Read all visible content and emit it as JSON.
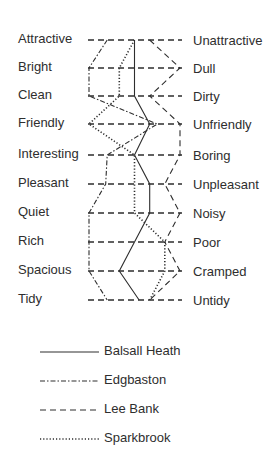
{
  "chart_data": {
    "type": "line",
    "title": "",
    "orientation": "semantic-differential profile (vertical scales)",
    "scale": {
      "min": 1,
      "max": 7,
      "x_left_px": 89,
      "x_right_px": 180
    },
    "left_labels": [
      "Attractive",
      "Bright",
      "Clean",
      "Friendly",
      "Interesting",
      "Pleasant",
      "Quiet",
      "Rich",
      "Spacious",
      "Tidy"
    ],
    "right_labels": [
      "Unattractive",
      "Dull",
      "Dirty",
      "Unfriendly",
      "Boring",
      "Unpleasant",
      "Noisy",
      "Poor",
      "Cramped",
      "Untidy"
    ],
    "row_y_px": [
      40,
      68,
      96,
      124,
      155,
      184,
      213,
      242,
      271,
      300
    ],
    "series": [
      {
        "name": "Balsall Heath",
        "style": "solid",
        "values": [
          4,
          4,
          4,
          5,
          4,
          5,
          5,
          4,
          3,
          4.3
        ]
      },
      {
        "name": "Edgbaston",
        "style": "dash-dot",
        "values": [
          2.2,
          1,
          1,
          5.5,
          2.2,
          2.1,
          1,
          1,
          1,
          2.2
        ]
      },
      {
        "name": "Lee Bank",
        "style": "dashed",
        "values": [
          5,
          7,
          5,
          7,
          7,
          6,
          7,
          6,
          7,
          5
        ]
      },
      {
        "name": "Sparkbrook",
        "style": "dotted",
        "values": [
          4,
          3,
          3,
          1,
          4,
          4,
          4,
          6,
          6,
          5
        ]
      }
    ],
    "legend_position": "bottom",
    "grid": "dashed horizontal rows"
  },
  "legend": {
    "items": [
      {
        "label": "Balsall Heath",
        "style": "solid"
      },
      {
        "label": "Edgbaston",
        "style": "dash-dot"
      },
      {
        "label": "Lee Bank",
        "style": "dashed"
      },
      {
        "label": "Sparkbrook",
        "style": "dotted"
      }
    ]
  },
  "colors": {
    "ink": "#2e2e2e",
    "background": "#ffffff"
  }
}
